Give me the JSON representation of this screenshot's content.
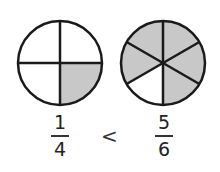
{
  "diagram": {
    "colors": {
      "shaded": "#c8c8c8",
      "unshaded": "#ffffff",
      "stroke": "#1a1a1a"
    },
    "left_circle": {
      "parts": 4,
      "shaded_parts": 1,
      "fraction": {
        "numerator": "1",
        "denominator": "4"
      }
    },
    "comparison_symbol": "<",
    "right_circle": {
      "parts": 6,
      "shaded_parts": 5,
      "fraction": {
        "numerator": "5",
        "denominator": "6"
      }
    }
  }
}
